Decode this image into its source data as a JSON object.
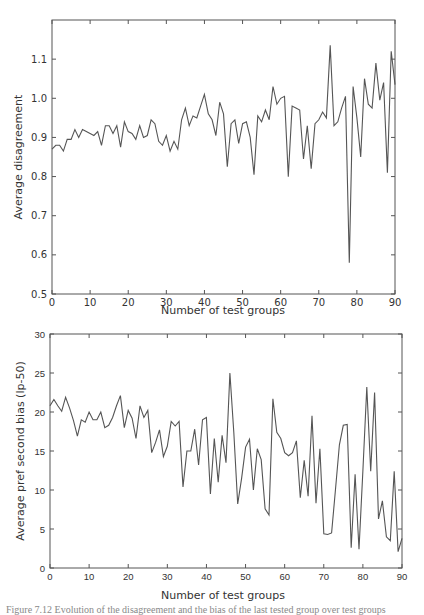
{
  "chart_data": [
    {
      "type": "line",
      "title": "",
      "xlabel": "Number of test groups",
      "ylabel": "Average disagreement",
      "xlim": [
        0,
        90
      ],
      "ylim": [
        0.5,
        1.2
      ],
      "xticks": [
        "0",
        "10",
        "20",
        "30",
        "40",
        "50",
        "60",
        "70",
        "80",
        "90"
      ],
      "yticks": [
        "0.5",
        "0.6",
        "0.7",
        "0.8",
        "0.9",
        "1.0",
        "1.1"
      ],
      "grid": false,
      "legend": null,
      "series": [
        {
          "name": "Average disagreement",
          "color": "#555555",
          "x": [
            0,
            1,
            2,
            3,
            4,
            5,
            6,
            7,
            8,
            9,
            10,
            11,
            12,
            13,
            14,
            15,
            16,
            17,
            18,
            19,
            20,
            21,
            22,
            23,
            24,
            25,
            26,
            27,
            28,
            29,
            30,
            31,
            32,
            33,
            34,
            35,
            36,
            37,
            38,
            39,
            40,
            41,
            42,
            43,
            44,
            45,
            46,
            47,
            48,
            49,
            50,
            51,
            52,
            53,
            54,
            55,
            56,
            57,
            58,
            59,
            60,
            61,
            62,
            63,
            64,
            65,
            66,
            67,
            68,
            69,
            70,
            71,
            72,
            73,
            74,
            75,
            76,
            77,
            78,
            79,
            80,
            81,
            82,
            83,
            84,
            85,
            86,
            87,
            88,
            89,
            90
          ],
          "values": [
            0.87,
            0.88,
            0.88,
            0.865,
            0.895,
            0.895,
            0.92,
            0.9,
            0.92,
            0.915,
            0.91,
            0.905,
            0.915,
            0.88,
            0.93,
            0.93,
            0.91,
            0.93,
            0.875,
            0.94,
            0.915,
            0.91,
            0.895,
            0.93,
            0.9,
            0.905,
            0.945,
            0.935,
            0.89,
            0.88,
            0.905,
            0.865,
            0.89,
            0.87,
            0.945,
            0.975,
            0.93,
            0.955,
            0.95,
            0.98,
            1.01,
            0.96,
            0.945,
            0.905,
            0.99,
            0.96,
            0.825,
            0.935,
            0.945,
            0.885,
            0.935,
            0.94,
            0.9,
            0.805,
            0.955,
            0.94,
            0.97,
            0.945,
            1.03,
            0.985,
            1.0,
            1.005,
            0.8,
            0.98,
            0.975,
            0.97,
            0.845,
            0.93,
            0.82,
            0.935,
            0.945,
            0.965,
            0.95,
            1.135,
            0.93,
            0.94,
            0.975,
            1.005,
            0.58,
            1.03,
            0.95,
            0.85,
            1.05,
            0.985,
            0.975,
            1.09,
            0.995,
            1.04,
            0.81,
            1.12,
            1.035
          ]
        }
      ]
    },
    {
      "type": "line",
      "title": "",
      "xlabel": "Number of test groups",
      "ylabel": "Average pref second bias (lp-50)",
      "xlim": [
        0,
        90
      ],
      "ylim": [
        0,
        30
      ],
      "xticks": [
        "0",
        "10",
        "20",
        "30",
        "40",
        "50",
        "60",
        "70",
        "80",
        "90"
      ],
      "yticks": [
        "0",
        "5",
        "10",
        "15",
        "20",
        "25",
        "30"
      ],
      "grid": false,
      "legend": null,
      "series": [
        {
          "name": "Average pref second bias (lp-50)",
          "color": "#555555",
          "x": [
            0,
            1,
            2,
            3,
            4,
            5,
            6,
            7,
            8,
            9,
            10,
            11,
            12,
            13,
            14,
            15,
            16,
            17,
            18,
            19,
            20,
            21,
            22,
            23,
            24,
            25,
            26,
            27,
            28,
            29,
            30,
            31,
            32,
            33,
            34,
            35,
            36,
            37,
            38,
            39,
            40,
            41,
            42,
            43,
            44,
            45,
            46,
            47,
            48,
            49,
            50,
            51,
            52,
            53,
            54,
            55,
            56,
            57,
            58,
            59,
            60,
            61,
            62,
            63,
            64,
            65,
            66,
            67,
            68,
            69,
            70,
            71,
            72,
            73,
            74,
            75,
            76,
            77,
            78,
            79,
            80,
            81,
            82,
            83,
            84,
            85,
            86,
            87,
            88,
            89,
            90
          ],
          "values": [
            20.8,
            21.6,
            20.8,
            20.1,
            21.9,
            20.5,
            18.9,
            16.9,
            19.0,
            18.7,
            20.0,
            19.0,
            19.0,
            20.0,
            18.0,
            18.3,
            19.3,
            20.8,
            22.1,
            18.0,
            20.2,
            19.2,
            16.6,
            20.8,
            19.3,
            20.2,
            14.8,
            16.1,
            17.7,
            14.3,
            15.6,
            18.8,
            18.2,
            18.8,
            10.4,
            15.0,
            15.0,
            17.8,
            13.2,
            19.0,
            19.3,
            9.5,
            16.6,
            11.0,
            17.0,
            13.5,
            25.0,
            17.4,
            8.2,
            11.5,
            15.5,
            16.5,
            10.0,
            15.3,
            13.9,
            7.6,
            6.8,
            21.7,
            17.4,
            16.6,
            14.8,
            14.4,
            14.8,
            16.3,
            9.0,
            13.8,
            9.2,
            19.5,
            8.3,
            15.3,
            4.4,
            4.3,
            4.5,
            10.1,
            15.8,
            18.3,
            18.4,
            2.6,
            12.0,
            2.4,
            12.5,
            23.2,
            12.4,
            22.5,
            6.3,
            8.6,
            4.0,
            3.5,
            12.4,
            2.1,
            3.8
          ]
        }
      ]
    }
  ],
  "caption_partial": "Figure 7.12   Evolution of the disagreement and the bias of the last tested group over test groups"
}
